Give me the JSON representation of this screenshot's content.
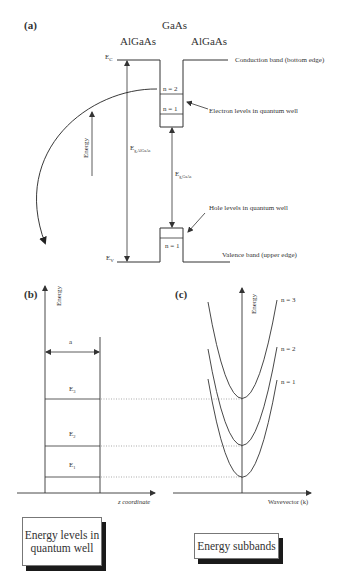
{
  "panel_a": {
    "label": "(a)",
    "material_center": "GaAs",
    "material_left": "AlGaAs",
    "material_right": "AlGaAs",
    "ec_label": "E",
    "ec_sub": "C",
    "ev_label": "E",
    "ev_sub": "V",
    "conduction_band_label": "Conduction band (bottom edge)",
    "valence_band_label": "Valence band (upper edge)",
    "electron_levels_label": "Electron levels in quantum well",
    "hole_levels_label": "Hole levels in quantum well",
    "electron_n2": "n = 2",
    "electron_n1": "n = 1",
    "hole_n1": "n = 1",
    "gap_algaas_label": "E",
    "gap_algaas_sub": "g,AlGaAs",
    "gap_gaas_label": "E",
    "gap_gaas_sub": "g,GaAs",
    "energy_axis_label": "Energy"
  },
  "panel_b": {
    "label": "(b)",
    "y_axis_label": "Energy",
    "x_axis_label": "z coordinate",
    "width_label": "a",
    "levels": [
      {
        "name": "E",
        "sub": "3"
      },
      {
        "name": "E",
        "sub": "2"
      },
      {
        "name": "E",
        "sub": "1"
      }
    ],
    "caption": "Energy levels in quantum well"
  },
  "panel_c": {
    "label": "(c)",
    "y_axis_label": "Energy",
    "x_axis_label": "Wavevector (k)",
    "subbands": [
      "n = 3",
      "n = 2",
      "n = 1"
    ],
    "caption": "Energy subbands"
  },
  "colors": {
    "line": "#333333",
    "dotted": "#888888",
    "shadow": "#1a1a1a"
  }
}
